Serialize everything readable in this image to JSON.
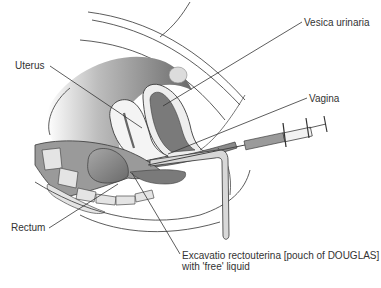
{
  "figure": {
    "labels": {
      "vesica": "Vesica urinaria",
      "uterus": "Uterus",
      "vagina": "Vagina",
      "rectum": "Rectum",
      "douglas_line1": "Excavatio rectouterina [pouch of DOUGLAS]",
      "douglas_line2": "with 'free' liquid"
    },
    "icons": [
      "syringe-icon"
    ],
    "colors": {
      "outline": "#3a3a3a",
      "dark_tissue": "#6e6e6e",
      "mid_tissue": "#9a9a9a",
      "light_tissue": "#d4d4d4",
      "pale_tissue": "#ececec",
      "background": "#ffffff"
    }
  }
}
